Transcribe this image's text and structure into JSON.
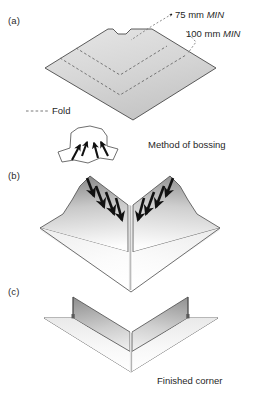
{
  "figure": {
    "background_color": "#ffffff",
    "line_color": "#3a3a3a",
    "fill_light": "#ffffff",
    "fill_mid": "#d9d9d9",
    "fill_dark": "#8e8e8e",
    "arrow_color": "#111111"
  },
  "panels": [
    {
      "id": "a",
      "label": "(a)",
      "description": "Flat plate blank with notch and dashed fold lines"
    },
    {
      "id": "b",
      "label": "(b)",
      "description": "Corner being bossed, arrows show hammering direction"
    },
    {
      "id": "c",
      "label": "(c)",
      "description": "Completed bossed corner"
    }
  ],
  "annotations": {
    "dim_75": {
      "value": "75 mm",
      "qualifier": "MIN"
    },
    "dim_100": {
      "value": "100 mm",
      "qualifier": "MIN"
    },
    "fold_legend": "Fold",
    "method_caption": "Method of bossing",
    "finished_caption": "Finished corner"
  }
}
